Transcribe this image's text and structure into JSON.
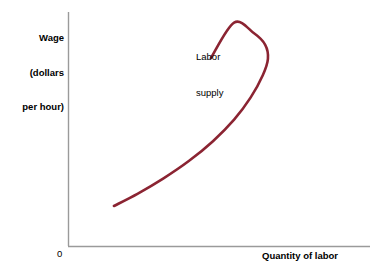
{
  "chart_data": {
    "type": "line",
    "title": "",
    "subtitle": "",
    "xlabel": "Quantity of labor",
    "ylabel": "Wage (dollars per hour)",
    "ylabel_lines": [
      "Wage",
      "(dollars",
      "per hour)"
    ],
    "origin_label": "0",
    "grid": false,
    "legend_position": "inline-annotation",
    "xlim": [
      0,
      100
    ],
    "ylim": [
      0,
      100
    ],
    "xticks": [],
    "yticks": [],
    "annotations": [
      {
        "name": "labor-supply-label",
        "text": "Labor supply",
        "lines": [
          "Labor",
          "supply"
        ],
        "x": 47,
        "y": 84
      }
    ],
    "series": [
      {
        "name": "Labor supply",
        "color": "#8B2432",
        "linewidth": 2.6,
        "shape": "backward-bending",
        "points": [
          {
            "x": 15.2,
            "y": 17.1
          },
          {
            "x": 23.0,
            "y": 22.3
          },
          {
            "x": 31.5,
            "y": 28.8
          },
          {
            "x": 40.0,
            "y": 36.3
          },
          {
            "x": 48.0,
            "y": 44.8
          },
          {
            "x": 55.0,
            "y": 54.0
          },
          {
            "x": 60.5,
            "y": 63.5
          },
          {
            "x": 64.5,
            "y": 73.0
          },
          {
            "x": 66.2,
            "y": 80.0
          },
          {
            "x": 65.3,
            "y": 86.0
          },
          {
            "x": 61.5,
            "y": 91.0
          },
          {
            "x": 55.0,
            "y": 95.5
          },
          {
            "x": 47.3,
            "y": 80.3
          }
        ]
      }
    ]
  },
  "axes": {
    "y_axis_title_lines": [
      "Wage",
      "(dollars",
      "per hour)"
    ],
    "x_axis_title": "Quantity of labor",
    "origin": "0",
    "axis_color": "#9a9a9a"
  },
  "curve": {
    "label_lines": [
      "Labor",
      "supply"
    ],
    "color": "#8B2432"
  },
  "colors": {
    "background": "#ffffff",
    "curve": "#8B2432",
    "axis": "#9a9a9a",
    "text": "#000000"
  }
}
